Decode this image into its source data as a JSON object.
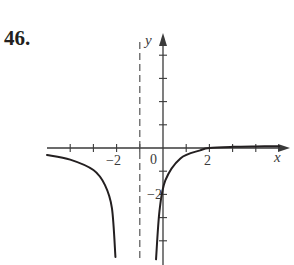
{
  "problem": {
    "number_label": "46."
  },
  "colors": {
    "ink": "#231f20",
    "axis": "#3a3a3a",
    "asymptote": "#555555",
    "background": "#ffffff"
  },
  "axes": {
    "x_label": "x",
    "y_label": "y",
    "origin_label": "0",
    "x_tick_labels": [
      {
        "value": -2,
        "text": "−2"
      },
      {
        "value": 2,
        "text": "2"
      }
    ],
    "y_tick_labels": [
      {
        "value": -2,
        "text": "−2"
      }
    ]
  },
  "chart_data": {
    "type": "line",
    "title": "46.",
    "xlabel": "x",
    "ylabel": "y",
    "xlim": [
      -5,
      5
    ],
    "ylim": [
      -4.8,
      4.5
    ],
    "grid": false,
    "legend": null,
    "x_ticks": [
      -4,
      -3,
      -2,
      -1,
      1,
      2,
      3,
      4
    ],
    "y_ticks": [
      -4,
      -3,
      -2,
      -1,
      1,
      2,
      3,
      4
    ],
    "labeled_x_ticks": [
      -2,
      2
    ],
    "labeled_y_ticks": [
      -2
    ],
    "asymptotes": [
      {
        "type": "vertical",
        "x": -1,
        "style": "dashed"
      }
    ],
    "series": [
      {
        "name": "left branch",
        "points": [
          [
            -5.0,
            -0.3
          ],
          [
            -4.0,
            -0.5
          ],
          [
            -3.0,
            -0.95
          ],
          [
            -2.5,
            -1.6
          ],
          [
            -2.2,
            -2.6
          ],
          [
            -2.05,
            -4.7
          ]
        ]
      },
      {
        "name": "right branch",
        "points": [
          [
            -0.3,
            -4.8
          ],
          [
            -0.15,
            -2.7
          ],
          [
            0.1,
            -1.4
          ],
          [
            0.75,
            -0.45
          ],
          [
            1.6,
            -0.1
          ],
          [
            2.0,
            0.0
          ],
          [
            3.0,
            0.05
          ],
          [
            4.0,
            0.07
          ],
          [
            5.0,
            0.08
          ]
        ]
      }
    ],
    "annotations": []
  }
}
